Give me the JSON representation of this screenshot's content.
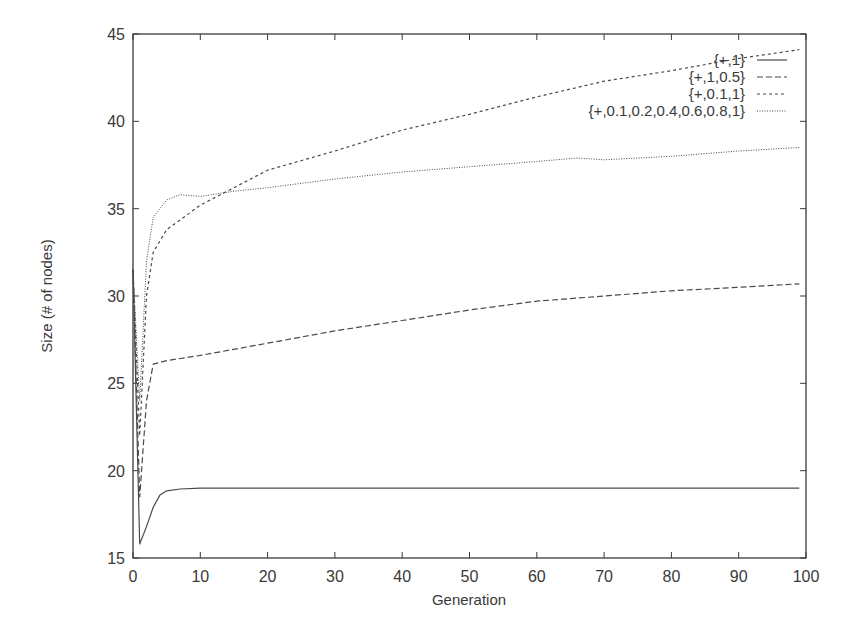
{
  "chart_data": {
    "type": "line",
    "title": "",
    "xlabel": "Generation",
    "ylabel": "Size (# of nodes)",
    "xlim": [
      0,
      100
    ],
    "ylim": [
      15,
      45
    ],
    "xticks": [
      0,
      10,
      20,
      30,
      40,
      50,
      60,
      70,
      80,
      90,
      100
    ],
    "yticks": [
      15,
      20,
      25,
      30,
      35,
      40,
      45
    ],
    "grid": false,
    "legend_position": "top-right-inside",
    "series": [
      {
        "name": "{+,1}",
        "style": "solid",
        "x": [
          0,
          1,
          2,
          3,
          4,
          5,
          7,
          10,
          20,
          30,
          40,
          50,
          60,
          70,
          80,
          90,
          99
        ],
        "values": [
          31.5,
          15.8,
          16.8,
          17.9,
          18.6,
          18.85,
          18.95,
          19.0,
          19.0,
          19.0,
          19.0,
          19.0,
          19.0,
          19.0,
          19.0,
          19.0,
          19.0
        ]
      },
      {
        "name": "{+,1,0.5}",
        "style": "dashed",
        "x": [
          0,
          1,
          2,
          3,
          5,
          10,
          20,
          30,
          40,
          50,
          60,
          70,
          80,
          90,
          99
        ],
        "values": [
          31.5,
          18.5,
          24.0,
          26.1,
          26.3,
          26.6,
          27.3,
          28.0,
          28.6,
          29.2,
          29.7,
          30.0,
          30.3,
          30.5,
          30.7
        ]
      },
      {
        "name": "{+,0.1,1}",
        "style": "short-dashed",
        "x": [
          0,
          1,
          2,
          3,
          5,
          10,
          15,
          20,
          30,
          40,
          50,
          60,
          70,
          80,
          90,
          99
        ],
        "values": [
          31.5,
          22.0,
          30.0,
          32.5,
          33.8,
          35.2,
          36.2,
          37.2,
          38.3,
          39.5,
          40.4,
          41.4,
          42.3,
          42.9,
          43.6,
          44.1
        ]
      },
      {
        "name": "{+,0.1,0.2,0.4,0.6,0.8,1}",
        "style": "dotted",
        "x": [
          0,
          1,
          2,
          3,
          5,
          7,
          10,
          15,
          20,
          30,
          40,
          50,
          60,
          66,
          70,
          80,
          90,
          99
        ],
        "values": [
          31.5,
          24.0,
          32.0,
          34.5,
          35.5,
          35.8,
          35.7,
          36.0,
          36.2,
          36.7,
          37.1,
          37.4,
          37.7,
          37.9,
          37.8,
          38.0,
          38.3,
          38.5
        ]
      }
    ]
  },
  "labels": {
    "xlabel": "Generation",
    "ylabel": "Size (# of nodes)",
    "legend": [
      "{+,1}",
      "{+,1,0.5}",
      "{+,0.1,1}",
      "{+,0.1,0.2,0.4,0.6,0.8,1}"
    ]
  },
  "colors": {
    "line": "#4a4a4a",
    "axis": "#3a3a3a",
    "background": "#ffffff"
  }
}
